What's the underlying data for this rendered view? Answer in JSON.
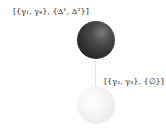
{
  "diagram": {
    "type": "node-link",
    "nodes": [
      {
        "id": "node-1",
        "label": "[{γ₁, γ₄}, {Δ¹, Δ²}]",
        "color": "#2e2e2e",
        "position": "top"
      },
      {
        "id": "node-2",
        "label": "[{γ₂, γ₃}, {∅}]",
        "color": "#eeeeee",
        "position": "bottom"
      }
    ],
    "edges": [
      {
        "from": "node-1",
        "to": "node-2",
        "color": "#e6e6e6"
      }
    ]
  }
}
